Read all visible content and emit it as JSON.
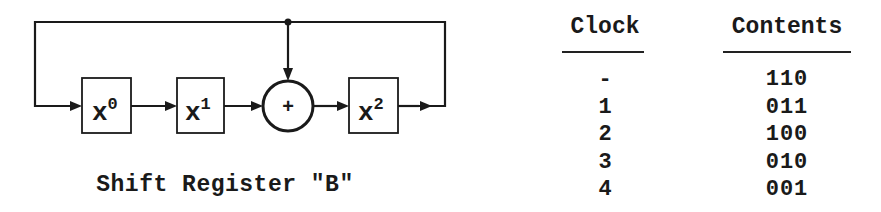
{
  "diagram": {
    "title": "Shift Register \"B\"",
    "stages": [
      {
        "label": "x",
        "exponent": "0"
      },
      {
        "label": "x",
        "exponent": "1"
      },
      {
        "label": "x",
        "exponent": "2"
      }
    ],
    "adder_symbol": "+",
    "connections": [
      "feedback: output of x^2 -> input of x^0",
      "tap: feedback line -> adder",
      "x^0 -> x^1",
      "x^1 -> adder",
      "adder -> x^2"
    ]
  },
  "table": {
    "headers": {
      "clock": "Clock",
      "contents": "Contents"
    },
    "rows": [
      {
        "clock": "-",
        "contents": "110"
      },
      {
        "clock": "1",
        "contents": "011"
      },
      {
        "clock": "2",
        "contents": "100"
      },
      {
        "clock": "3",
        "contents": "010"
      },
      {
        "clock": "4",
        "contents": "001"
      }
    ]
  },
  "colors": {
    "ink": "#1a1a1a",
    "background": "#ffffff"
  }
}
